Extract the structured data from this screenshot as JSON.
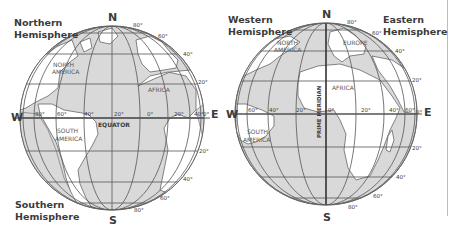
{
  "maps": [
    {
      "id": "left-globe",
      "labels": {
        "top_left": [
          "Northern",
          "Hemisphere"
        ],
        "bottom_left": [
          "Southern",
          "Hemisphere"
        ],
        "north": "N",
        "south": "S",
        "west": "W",
        "east": "E",
        "equator": "EQUATOR",
        "continents": [
          "NORTH",
          "AMERICA",
          "SOUTH",
          "AMERICA",
          "AFRICA"
        ]
      },
      "longitude_labels": [
        "80°",
        "60°",
        "40°",
        "20°",
        "0°",
        "20°",
        "40°"
      ],
      "latitude_labels_north": [
        "80°",
        "60°",
        "40°",
        "20°"
      ],
      "latitude_labels_south": [
        "20°",
        "40°",
        "60°",
        "80°"
      ],
      "equator_degree": "0°"
    },
    {
      "id": "right-globe",
      "labels": {
        "top_left": [
          "Western",
          "Hemisphere"
        ],
        "top_right": [
          "Eastern",
          "Hemisphere"
        ],
        "north": "N",
        "south": "S",
        "west": "W",
        "east": "E",
        "prime_meridian": "PRIME MERIDIAN",
        "continents": [
          "NORTH",
          "AMERICA",
          "EUROPE",
          "AFRICA",
          "SOUTH",
          "AMERICA"
        ]
      },
      "longitude_labels": [
        "60°",
        "40°",
        "20°",
        "0°",
        "20°",
        "40°",
        "60°"
      ],
      "latitude_labels_north": [
        "80°",
        "60°",
        "40°",
        "20°"
      ],
      "latitude_labels_south": [
        "20°",
        "40°",
        "60°",
        "80°"
      ],
      "equator_degree": "0°"
    }
  ],
  "colors": {
    "ocean": "#d9d9d9",
    "land": "#ffffff",
    "grid": "#555555",
    "outline": "#666666"
  }
}
